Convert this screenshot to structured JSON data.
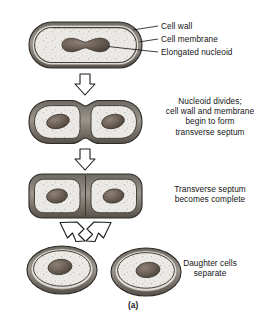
{
  "figure": {
    "caption": "(a)",
    "title_implied": "Binary fission in a bacterial cell"
  },
  "colors": {
    "cytoplasm": "#e8e6e3",
    "wall_outer": "#3a3733",
    "wall_gap": "#d9d6d1",
    "wall_inner": "#4a4641",
    "nucleoid": "#6e6258",
    "nucleoid_edge": "#4a423a",
    "arrow_fill": "#ffffff",
    "arrow_stroke": "#1c1c1c",
    "text": "#151515",
    "leader_line": "#1c1c1c"
  },
  "callouts": [
    {
      "id": "cell-wall",
      "label": "Cell wall"
    },
    {
      "id": "cell-membrane",
      "label": "Cell membrane"
    },
    {
      "id": "elongated-nucleoid",
      "label": "Elongated nucleoid"
    }
  ],
  "stages": [
    {
      "id": "stage-1",
      "name": "elongated-cell",
      "shape": "rod",
      "nucleoid_count": 1,
      "nucleoid_shape": "dumbbell",
      "description_lines": []
    },
    {
      "id": "stage-2",
      "name": "nucleoid-divides",
      "shape": "constricted-rod",
      "nucleoid_count": 2,
      "nucleoid_shape": "oval",
      "description_lines": [
        "Nucleoid divides;",
        "cell wall and membrane",
        "begin to form",
        "transverse septum"
      ]
    },
    {
      "id": "stage-3",
      "name": "transverse-septum-complete",
      "shape": "septate-rod",
      "nucleoid_count": 2,
      "nucleoid_shape": "oval",
      "description_lines": [
        "Transverse septum",
        "becomes complete"
      ]
    },
    {
      "id": "stage-4",
      "name": "daughter-cells-separate",
      "shape": "two-ovals",
      "nucleoid_count": 2,
      "nucleoid_shape": "oval",
      "description_lines": [
        "Daughter cells",
        "separate"
      ]
    }
  ],
  "arrows": [
    {
      "id": "arrow-1",
      "from": "stage-1",
      "to": "stage-2",
      "direction": "down"
    },
    {
      "id": "arrow-2",
      "from": "stage-2",
      "to": "stage-3",
      "direction": "down"
    },
    {
      "id": "arrow-3",
      "from": "stage-3",
      "to": "stage-4-left",
      "direction": "down-left"
    },
    {
      "id": "arrow-4",
      "from": "stage-3",
      "to": "stage-4-right",
      "direction": "down-right"
    }
  ]
}
